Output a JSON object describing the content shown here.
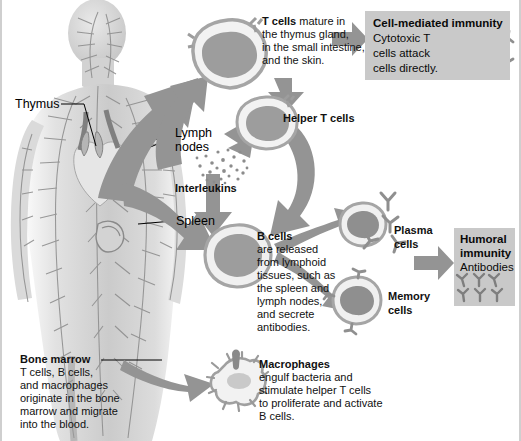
{
  "figure": {
    "colors": {
      "arrow": "#8f8f8f",
      "arrow_dark": "#7b7b7b",
      "box_bg": "#c9c9c9",
      "cell_outline": "#9a9a9a",
      "cell_fill": "#efefef",
      "nucleus": "#9e9e9e",
      "body": "#bdbdbd",
      "vessel": "#8a8a8a",
      "text": "#111111"
    }
  },
  "anatomy_labels": [
    {
      "name": "thymus",
      "text": "Thymus"
    },
    {
      "name": "lymph-nodes",
      "text_line1": "Lymph",
      "text_line2": "nodes"
    },
    {
      "name": "spleen",
      "text": "Spleen"
    }
  ],
  "annotations": {
    "t_cells": {
      "heading": "T cells",
      "lines": [
        "mature in",
        "the thymus gland,",
        "in the small intestine,",
        "and the skin."
      ],
      "first_line_rest": " mature in"
    },
    "helper_t_cells": {
      "heading": "Helper T cells"
    },
    "interleukins": {
      "heading": "Interleukins"
    },
    "b_cells": {
      "heading": "B cells",
      "lines": [
        "are released",
        "from lymphoid",
        "tissues, such as",
        "the spleen and",
        "lymph nodes,",
        "and secrete",
        "antibodies."
      ]
    },
    "plasma_cells": {
      "line1": "Plasma",
      "line2": "cells"
    },
    "memory_cells": {
      "line1": "Memory",
      "line2": "cells"
    },
    "macrophages": {
      "heading": "Macrophages",
      "lines": [
        "engulf bacteria and",
        "stimulate helper T cells",
        "to proliferate and activate",
        "B cells."
      ]
    },
    "bone_marrow": {
      "heading": "Bone marrow",
      "lines": [
        "T cells, B cells,",
        "and macrophages",
        "originate in the bone",
        "marrow and migrate",
        "into the blood."
      ]
    }
  },
  "outcome_boxes": {
    "cell_mediated": {
      "title": "Cell-mediated immunity",
      "lines": [
        "Cytotoxic T",
        "cells attack",
        "cells directly."
      ]
    },
    "humoral": {
      "title_line1": "Humoral",
      "title_line2": "immunity",
      "subtitle": "Antibodies"
    }
  }
}
